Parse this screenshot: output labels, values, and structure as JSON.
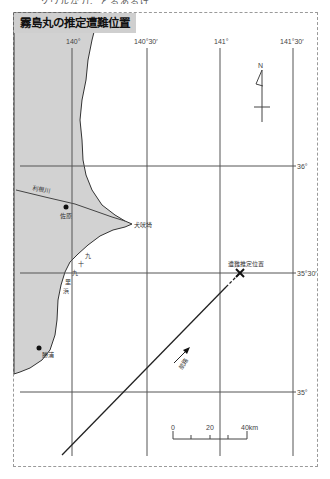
{
  "top_strip_text": "ソウルな力、とるあるげ",
  "title": "霧島丸の推定遭難位置",
  "longitudes": [
    {
      "label": "140°",
      "x": 72
    },
    {
      "label": "140°30′",
      "x": 147
    },
    {
      "label": "141°",
      "x": 220
    },
    {
      "label": "141°30′",
      "x": 293
    }
  ],
  "latitudes": [
    {
      "label": "36°",
      "y": 166
    },
    {
      "label": "35°30′",
      "y": 273
    },
    {
      "label": "35°",
      "y": 392
    }
  ],
  "places": {
    "river": "利根川",
    "choshi": "佐原",
    "cape": "犬吠埼",
    "katsuura": "勝浦",
    "kujukuri_1": "九",
    "kujukuri_2": "十",
    "kujukuri_3": "九",
    "kujukuri_4": "里",
    "kujukuri_5": "浜"
  },
  "wreck_label": "遭難推定位置",
  "route_label": "航路",
  "compass_label": "N",
  "scale": {
    "labels": [
      "0",
      "20",
      "40km"
    ]
  },
  "colors": {
    "land": "#d2d2d2",
    "grid": "#555555",
    "route": "#222222",
    "frame": "#9a9a9a"
  }
}
